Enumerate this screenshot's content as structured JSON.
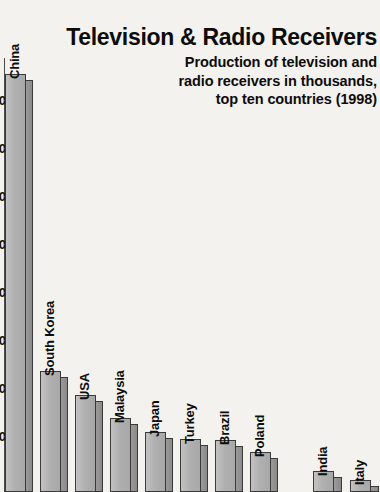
{
  "chart_data": {
    "type": "bar",
    "title": "Television & Radio Receivers",
    "subtitle_lines": [
      "Production of television and",
      "radio receivers in thousands,",
      "top ten countries (1998)"
    ],
    "xlabel": "",
    "ylabel": "",
    "units": "thousands",
    "year": 1998,
    "grid": false,
    "legend": "none",
    "categories": [
      "China",
      "South Korea",
      "USA",
      "Malaysia",
      "Japan",
      "Turkey",
      "Brazil",
      "Poland",
      "India",
      "Italy"
    ],
    "values": [
      50000,
      12000,
      9500,
      7000,
      5800,
      5200,
      5100,
      4000,
      2100,
      1300
    ],
    "ylim": [
      0,
      52000
    ],
    "tick_labels_clipped": [
      "0",
      "0",
      "0",
      "0",
      "0",
      "0",
      "0",
      "0"
    ],
    "bar_style": "3d-extruded",
    "colors": {
      "background": "#f4f2ee",
      "bar_front": "#b3b3b3",
      "bar_side": "#8f8f8f",
      "bar_outline": "#3a3a3a",
      "text": "#0d0d0d",
      "axis": "#4a4a4a"
    },
    "bars": [
      {
        "label": "China",
        "top": 74,
        "front_x": 5,
        "front_w": 21,
        "side_w": 7
      },
      {
        "label": "South Korea",
        "top": 371,
        "front_x": 40,
        "front_w": 21,
        "side_w": 7
      },
      {
        "label": "USA",
        "top": 395,
        "front_x": 75,
        "front_w": 21,
        "side_w": 7
      },
      {
        "label": "Malaysia",
        "top": 418,
        "front_x": 110,
        "front_w": 21,
        "side_w": 7
      },
      {
        "label": "Japan",
        "top": 432,
        "front_x": 145,
        "front_w": 21,
        "side_w": 7
      },
      {
        "label": "Turkey",
        "top": 439,
        "front_x": 180,
        "front_w": 21,
        "side_w": 7
      },
      {
        "label": "Brazil",
        "top": 440,
        "front_x": 215,
        "front_w": 21,
        "side_w": 7
      },
      {
        "label": "Poland",
        "top": 452,
        "front_x": 250,
        "front_w": 21,
        "side_w": 7
      },
      {
        "label": "India",
        "top": 471,
        "front_x": 313,
        "front_w": 21,
        "side_w": 8
      },
      {
        "label": "Italy",
        "top": 480,
        "front_x": 350,
        "front_w": 21,
        "side_w": 8
      }
    ],
    "ticks": [
      {
        "label": "0",
        "y": 100
      },
      {
        "label": "0",
        "y": 148
      },
      {
        "label": "0",
        "y": 196
      },
      {
        "label": "0",
        "y": 244
      },
      {
        "label": "0",
        "y": 292
      },
      {
        "label": "0",
        "y": 340
      },
      {
        "label": "0",
        "y": 388
      },
      {
        "label": "0",
        "y": 436
      }
    ],
    "label_offsets": {
      "China": 68,
      "South Korea": 365,
      "USA": 389,
      "Malaysia": 412,
      "Japan": 426,
      "Turkey": 433,
      "Brazil": 434,
      "Poland": 446,
      "India": 465,
      "Italy": 474
    }
  }
}
